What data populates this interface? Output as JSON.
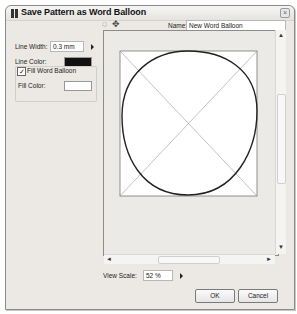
{
  "window": {
    "title": "Save Pattern as Word Balloon",
    "close_glyph": "×"
  },
  "toolbar": {
    "icons": [
      {
        "name": "lasso-icon",
        "glyph": "◌"
      },
      {
        "name": "move-icon",
        "glyph": "✥"
      }
    ]
  },
  "name_field": {
    "label": "Name:",
    "value": "New Word Balloon"
  },
  "settings": {
    "line_width": {
      "label": "Line Width:",
      "value": "0.3 mm"
    },
    "line_color": {
      "label": "Line Color:",
      "color": "#111111"
    },
    "fill_word_balloon": {
      "label": "Fill Word Balloon",
      "checked": true,
      "check_glyph": "✓"
    },
    "fill_color": {
      "label": "Fill Color:",
      "color": "#ffffff"
    }
  },
  "preview": {
    "line_color": "#222222",
    "guide_color": "#888888"
  },
  "scrollbars": {
    "up": "▲",
    "down": "▼",
    "left": "◄",
    "right": "►"
  },
  "view_scale": {
    "label": "View Scale:",
    "value": "52 %"
  },
  "buttons": {
    "ok": "OK",
    "cancel": "Cancel"
  }
}
